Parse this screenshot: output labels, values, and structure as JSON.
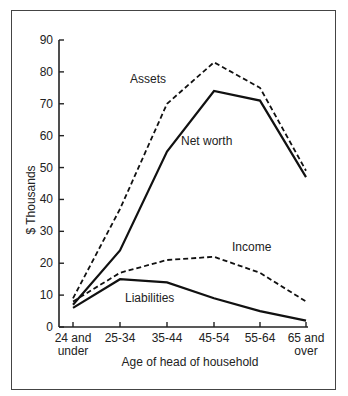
{
  "chart_data": {
    "type": "line",
    "title": "",
    "xlabel": "Age of head of household",
    "ylabel": "$ Thousands",
    "ylim": [
      0,
      90
    ],
    "yticks": [
      0,
      10,
      20,
      30,
      40,
      50,
      60,
      70,
      80,
      90
    ],
    "grid": false,
    "legend_position": "inline labels",
    "categories": [
      "24 and under",
      "25-34",
      "35-44",
      "45-54",
      "55-64",
      "65 and over"
    ],
    "category_lines": [
      [
        "24 and",
        "under"
      ],
      [
        "25-34"
      ],
      [
        "35-44"
      ],
      [
        "45-54"
      ],
      [
        "55-64"
      ],
      [
        "65 and",
        "over"
      ]
    ],
    "series": [
      {
        "name": "Assets",
        "style": "dashed",
        "values": [
          9,
          37,
          70,
          83,
          75,
          49
        ]
      },
      {
        "name": "Net worth",
        "style": "solid",
        "values": [
          7,
          24,
          55,
          74,
          71,
          47
        ]
      },
      {
        "name": "Income",
        "style": "dashed",
        "values": [
          8,
          17,
          21,
          22,
          17,
          8
        ]
      },
      {
        "name": "Liabilities",
        "style": "solid",
        "values": [
          6,
          15,
          14,
          9,
          5,
          2
        ]
      }
    ],
    "annotations": [
      {
        "text": "Assets",
        "series": "Assets"
      },
      {
        "text": "Net worth",
        "series": "Net worth"
      },
      {
        "text": "Income",
        "series": "Income"
      },
      {
        "text": "Liabilities",
        "series": "Liabilities"
      }
    ]
  }
}
